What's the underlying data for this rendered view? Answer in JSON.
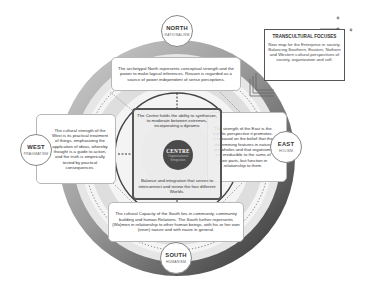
{
  "diagram": {
    "directions": {
      "north": {
        "name": "NORTH",
        "subtitle": "RATIONALISM",
        "description": "The archetypal North represents conceptual strength and the power to make logical inferences. Reason is regarded as a source of power independent of sense perceptions."
      },
      "east": {
        "name": "EAST",
        "subtitle": "HOLISM",
        "description": "The strength of the East is the holistic perspective it promotes. It is based on the belief that the determining features in nature are wholes and that organisms are irreducible to the sums of their parts, but function in relationship to them."
      },
      "south": {
        "name": "SOUTH",
        "subtitle": "HUMANISM",
        "description": "The cultural Capacity of the South lies in community, community building and human Relations. The South further represents (Wo)men in relationship to other human beings, with his or her own (inner) nature and with naure in general."
      },
      "west": {
        "name": "WEST",
        "subtitle": "PRAGMATISM",
        "description": "The cultural strength of the West is its practical treatment of things, emphasizing the application of ideas, whereby thought is a guide to action, and the truth is empirically tested by practical consequences."
      }
    },
    "centre": {
      "name": "CENTRE",
      "subtitle": "Organisational Integration",
      "top_text": "The Centre holds the ability to synthesize, to moderate between extremes, incorporating a dynamic",
      "bottom_text": "Balance and integration that serves to interconnect and renew the four different Worlds."
    },
    "transcultural_focuses": {
      "title": "TRANSCULTURAL FOCUSES",
      "body": "New map for the Enterprise in society. Balancing Southern, Eastern, Nothern and Western cultural perspectives of society, organization and self."
    },
    "colors": {
      "ring_dark": "#4a4a4a",
      "ring_light": "#d9d9d9",
      "centre_circle": "#4a4a4a",
      "box_border": "#b8b8b8",
      "accent_dot": "#666666"
    }
  }
}
